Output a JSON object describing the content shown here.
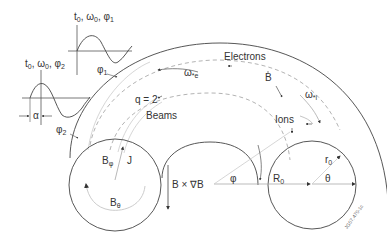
{
  "diagram": {
    "waveforms": {
      "upper": {
        "label": "t",
        "sub0": "0",
        "label_rest": ", ω",
        "sub1": "0",
        "label_phi": ", φ",
        "sub2": "1"
      },
      "lower": {
        "label": "t",
        "sub0": "0",
        "label_rest": ", ω",
        "sub1": "0",
        "label_phi": ", φ",
        "sub2": "2"
      },
      "phase_shift_label": "α"
    },
    "labels": {
      "phi1": "φ",
      "phi1_sub": "1",
      "phi2": "φ",
      "phi2_sub": "2",
      "electrons": "Electrons",
      "omega_e": "ω",
      "omega_e_sub": "*e",
      "B_vec": "B",
      "omega_i": "ω",
      "omega_i_sub": "*i",
      "ions": "Ions",
      "q_surface": "q = 2",
      "beams": "Beams",
      "B_phi": "B",
      "B_phi_sub": "φ",
      "J_vec": "J",
      "B_theta": "B",
      "B_theta_sub": "θ",
      "BxgradB": "B × ∇B",
      "phi": "φ",
      "R0": "R",
      "R0_sub": "0",
      "r0": "r",
      "r0_sub": "0",
      "theta": "θ"
    },
    "watermark": "JG07.470-1c",
    "colors": {
      "line": "#333333",
      "dashed": "#aaaaaa",
      "light": "#cccccc"
    }
  }
}
